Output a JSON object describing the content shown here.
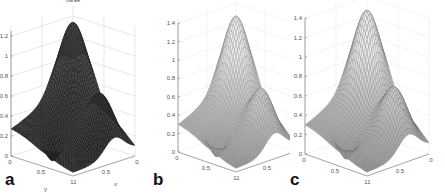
{
  "figure": {
    "panels": [
      {
        "label": "a",
        "title": "franke",
        "style": "dark"
      },
      {
        "label": "b",
        "title": "",
        "style": "light"
      },
      {
        "label": "c",
        "title": "",
        "style": "light"
      }
    ]
  },
  "chart_data": [
    {
      "type": "surface",
      "panel": "a",
      "title": "franke",
      "xlabel": "x",
      "ylabel": "y",
      "zlabel": "",
      "x_ticks": [
        "0",
        "0.5",
        "1"
      ],
      "y_ticks": [
        "0",
        "0.5",
        "1"
      ],
      "z_ticks": [
        "0",
        "0.2",
        "0.4",
        "0.6",
        "0.8",
        "1",
        "1.2"
      ],
      "xlim": [
        0,
        1
      ],
      "ylim": [
        0,
        1
      ],
      "zlim": [
        0,
        1.25
      ],
      "grid": true,
      "function": "Franke's function",
      "peak_z": 1.22,
      "mesh_color": "#2a2a2a"
    },
    {
      "type": "surface",
      "panel": "b",
      "title": "",
      "xlabel": "",
      "ylabel": "",
      "zlabel": "",
      "x_ticks": [
        "0",
        "0.5",
        "1"
      ],
      "y_ticks": [
        "0",
        "0.5",
        "1"
      ],
      "z_ticks": [
        "0",
        "0.2",
        "0.4",
        "0.6",
        "0.8",
        "1",
        "1.2",
        "1.4"
      ],
      "xlim": [
        0,
        1
      ],
      "ylim": [
        0,
        1
      ],
      "zlim": [
        0,
        1.4
      ],
      "grid": true,
      "function": "Franke's function (interpolant)",
      "peak_z": 1.35,
      "mesh_color": "#777777"
    },
    {
      "type": "surface",
      "panel": "c",
      "title": "",
      "xlabel": "",
      "ylabel": "",
      "zlabel": "",
      "x_ticks": [
        "0",
        "0.5",
        "1"
      ],
      "y_ticks": [
        "0",
        "0.5",
        "1"
      ],
      "z_ticks": [
        "0",
        "0.2",
        "0.4",
        "0.6",
        "0.8",
        "1",
        "1.2",
        "1.4"
      ],
      "xlim": [
        0,
        1
      ],
      "ylim": [
        0,
        1
      ],
      "zlim": [
        0,
        1.4
      ],
      "grid": true,
      "function": "Franke's function (interpolant)",
      "peak_z": 1.35,
      "mesh_color": "#666666"
    }
  ]
}
